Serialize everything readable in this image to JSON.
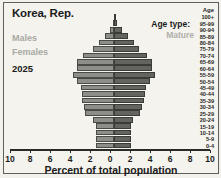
{
  "chart_data": {
    "type": "bar",
    "title": "Korea, Rep.",
    "subtitle": "2025",
    "xlabel": "Percent of total population",
    "ylabel": "Age",
    "xlim": [
      -10,
      10
    ],
    "xticks": [
      "10",
      "8",
      "6",
      "4",
      "2",
      "0",
      "2",
      "4",
      "6",
      "8",
      "10"
    ],
    "grid": false,
    "legend_position": "top-left",
    "age_type_label": "Age type:",
    "age_type_value": "Mature",
    "categories": [
      "100+",
      "95-99",
      "90-94",
      "85-89",
      "80-84",
      "75-79",
      "70-74",
      "65-69",
      "60-64",
      "55-59",
      "50-54",
      "45-49",
      "40-44",
      "35-39",
      "30-34",
      "25-29",
      "20-24",
      "15-19",
      "10-14",
      "5-9",
      "0-4"
    ],
    "series": [
      {
        "name": "Males",
        "color": "#8e8e89",
        "values": [
          0.04,
          0.15,
          0.45,
          0.95,
          1.6,
          2.2,
          3.2,
          3.9,
          3.9,
          4.3,
          3.9,
          3.4,
          3.3,
          3.3,
          3.1,
          3.0,
          2.2,
          1.9,
          1.9,
          1.9,
          1.9
        ]
      },
      {
        "name": "Females",
        "color": "#63635f",
        "values": [
          0.12,
          0.35,
          0.85,
          1.5,
          2.1,
          2.6,
          3.4,
          4.0,
          4.0,
          4.3,
          3.8,
          3.3,
          3.2,
          3.1,
          2.9,
          2.7,
          2.0,
          1.8,
          1.8,
          1.8,
          1.8
        ]
      }
    ]
  },
  "legend": {
    "males": "Males",
    "females": "Females"
  },
  "axis": {
    "tick_labels": [
      "10",
      "8",
      "6",
      "4",
      "2",
      "0",
      "2",
      "4",
      "6",
      "8",
      "10"
    ]
  }
}
